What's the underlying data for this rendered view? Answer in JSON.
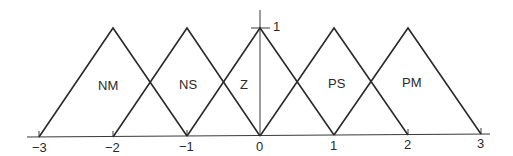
{
  "diagram": {
    "type": "fuzzy-membership-functions",
    "x_axis": {
      "ticks": [
        {
          "value": -3,
          "label": "−3"
        },
        {
          "value": -2,
          "label": "−2"
        },
        {
          "value": -1,
          "label": "−1"
        },
        {
          "value": 0,
          "label": "0"
        },
        {
          "value": 1,
          "label": "1"
        },
        {
          "value": 2,
          "label": "2"
        },
        {
          "value": 3,
          "label": "3"
        }
      ]
    },
    "y_axis": {
      "max_label": "1"
    },
    "sets": [
      {
        "name": "NM",
        "left": -3,
        "peak": -2,
        "right": -1
      },
      {
        "name": "NS",
        "left": -2,
        "peak": -1,
        "right": 0
      },
      {
        "name": "Z",
        "left": -1,
        "peak": 0,
        "right": 1
      },
      {
        "name": "PS",
        "left": 0,
        "peak": 1,
        "right": 2
      },
      {
        "name": "PM",
        "left": 1,
        "peak": 2,
        "right": 3
      }
    ],
    "line_color": "#2a2a2a"
  }
}
